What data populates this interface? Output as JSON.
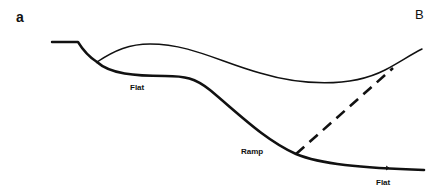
{
  "figure": {
    "panel_label_left": "a",
    "panel_label_right": "B",
    "labels": {
      "flat_upper": "Flat",
      "ramp": "Ramp",
      "flat_lower": "Flat"
    },
    "colors": {
      "line": "#111111",
      "background": "#ffffff"
    },
    "elements": [
      "initial-flat-segment",
      "thin-upper-curve",
      "thick-lower-fault-curve",
      "dashed-branch-line",
      "slip-direction-arrow"
    ]
  }
}
